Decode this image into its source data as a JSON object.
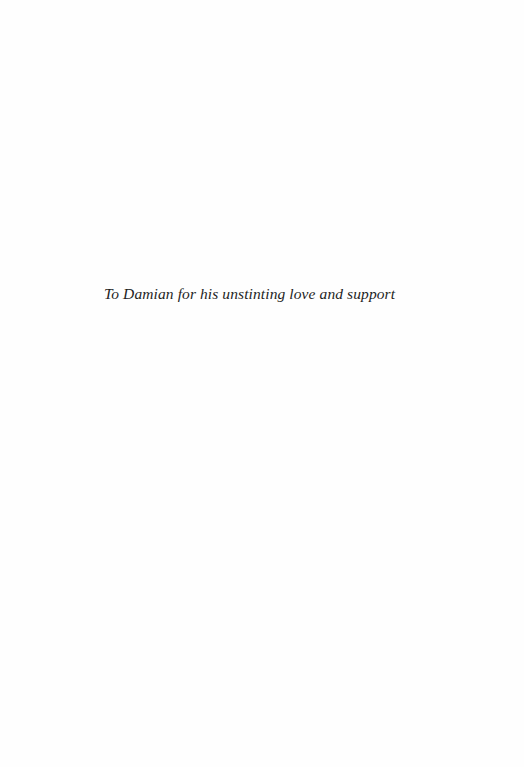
{
  "page": {
    "type": "dedication",
    "dedication_text": "To Damian for his unstinting love and support"
  },
  "colors": {
    "background": "#fefefe",
    "text": "#1e1e1e"
  }
}
